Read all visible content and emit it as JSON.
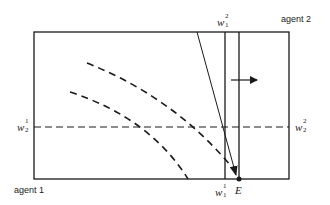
{
  "diagram": {
    "type": "edgeworth-box",
    "labels": {
      "agent_bottom_left": "agent 1",
      "agent_top_right": "agent 2",
      "endowment_point": "E"
    },
    "variables": {
      "w1_2": {
        "base": "w",
        "sup": "2",
        "sub": "1"
      },
      "w1_1": {
        "base": "w",
        "sup": "1",
        "sub": "1"
      },
      "w2_1": {
        "base": "w",
        "sup": "1",
        "sub": "2"
      },
      "w2_2": {
        "base": "w",
        "sup": "2",
        "sub": "2"
      }
    },
    "colors": {
      "stroke": "#1a1a1a",
      "background": "#ffffff"
    }
  }
}
